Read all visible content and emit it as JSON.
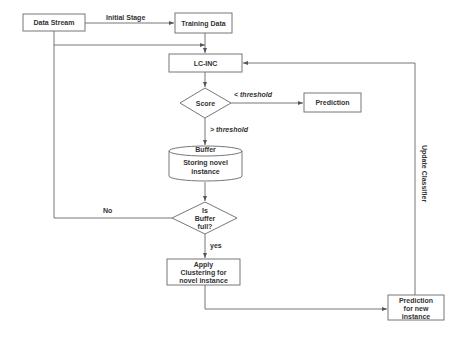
{
  "diagram": {
    "nodes": {
      "data_stream": {
        "label": "Data Stream"
      },
      "training_data": {
        "label": "Training Data"
      },
      "lc_inc": {
        "label": "LC-INC"
      },
      "score": {
        "label": "Score"
      },
      "prediction": {
        "label": "Prediction"
      },
      "buffer": {
        "title": "Buffer",
        "line1": "Storing novel",
        "line2": "instance"
      },
      "is_buffer_full": {
        "line1": "Is",
        "line2": "Buffer",
        "line3": "full?"
      },
      "apply_clustering": {
        "line1": "Apply",
        "line2": "Clustering  for",
        "line3": "novel instance"
      },
      "prediction_new": {
        "line1": "Prediction",
        "line2": "for new",
        "line3": "instance"
      }
    },
    "edges": {
      "initial_stage": "Initial Stage",
      "lt_threshold": "< threshold",
      "gt_threshold": "> threshold",
      "no": "No",
      "yes": "yes",
      "update_classifier": "Update Classifier"
    },
    "colors": {
      "stroke": "#777777",
      "text": "#333333",
      "background": "#ffffff"
    }
  }
}
